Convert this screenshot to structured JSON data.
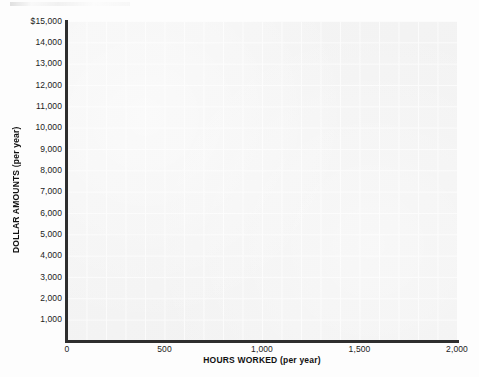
{
  "chart_data": {
    "type": "line",
    "title": "",
    "subtitle": "",
    "xlabel": "HOURS WORKED (per year)",
    "ylabel": "DOLLAR AMOUNTS (per year)",
    "xlim": [
      0,
      2000
    ],
    "ylim": [
      0,
      15000
    ],
    "x_ticks": [
      0,
      500,
      1000,
      1500,
      2000
    ],
    "x_tick_labels": [
      "0",
      "500",
      "1,000",
      "1,500",
      "2,000"
    ],
    "y_ticks": [
      1000,
      2000,
      3000,
      4000,
      5000,
      6000,
      7000,
      8000,
      9000,
      10000,
      11000,
      12000,
      13000,
      14000,
      15000
    ],
    "y_tick_labels": [
      "1,000",
      "2,000",
      "3,000",
      "4,000",
      "5,000",
      "6,000",
      "7,000",
      "8,000",
      "9,000",
      "10,000",
      "11,000",
      "12,000",
      "13,000",
      "14,000",
      "$15,000"
    ],
    "series": [],
    "values": [],
    "categories": [],
    "annotations": [],
    "grid": true,
    "grid_minor_x_step": 100,
    "grid_minor_y_step": 1000,
    "legend": false,
    "legend_position": "none",
    "plot_background_color": "#f2f2f2",
    "grid_line_color": "#ffffff",
    "axis_line_color": "#2e2e2e",
    "page_background_color": "#fdfdfd",
    "note": "empty plotting grid with no data series drawn"
  }
}
